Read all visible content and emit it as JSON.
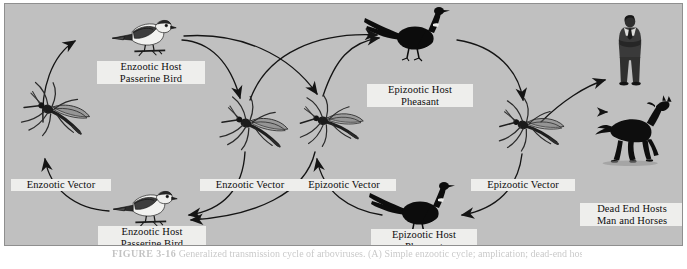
{
  "figure": {
    "caption_label": "FIGURE 3-16",
    "caption_text": "Generalized transmission cycle of arboviruses. (A) Simple enzootic cycle; amplication; dead-end hosts.",
    "background_color": "#c0c0c0",
    "border_color": "#8f8f8f",
    "ink_color": "#111111",
    "label_bg_color": "#eeeeec"
  },
  "nodes": [
    {
      "id": "enzootic-vector-left",
      "icon": "mosquito-icon",
      "label_lines": [
        "Enzootic Vector"
      ]
    },
    {
      "id": "enzootic-host-top",
      "icon": "passerine-bird-icon",
      "label_lines": [
        "Enzootic Host",
        "Passerine Bird"
      ]
    },
    {
      "id": "enzootic-vector-mid",
      "icon": "mosquito-icon",
      "label_lines": [
        "Enzootic Vector"
      ]
    },
    {
      "id": "epizootic-vector-mid",
      "icon": "mosquito-icon",
      "label_lines": [
        "Epizootic Vector"
      ]
    },
    {
      "id": "epizootic-host-top",
      "icon": "pheasant-icon",
      "label_lines": [
        "Epizootic Host",
        "Pheasant"
      ]
    },
    {
      "id": "epizootic-vector-right",
      "icon": "mosquito-icon",
      "label_lines": [
        "Epizootic Vector"
      ]
    },
    {
      "id": "dead-end-hosts",
      "icon": "man-and-horse-icon",
      "label_lines": [
        "Dead End Hosts",
        "Man and Horses"
      ]
    },
    {
      "id": "epizootic-host-bottom",
      "icon": "pheasant-icon",
      "label_lines": [
        "Epizootic Host",
        "Pheasant"
      ]
    },
    {
      "id": "enzootic-host-bottom",
      "icon": "passerine-bird-icon",
      "label_lines": [
        "Enzootic Host",
        "Passerine Bird"
      ]
    }
  ],
  "edges": [
    {
      "id": "edge-enz-vector-to-enz-bird-top",
      "from": "enzootic-vector-left",
      "to": "enzootic-host-top"
    },
    {
      "id": "edge-enz-bird-bottom-to-enz-vector",
      "from": "enzootic-host-bottom",
      "to": "enzootic-vector-left"
    },
    {
      "id": "edge-enz-bird-top-to-enz-vector-mid",
      "from": "enzootic-host-top",
      "to": "enzootic-vector-mid"
    },
    {
      "id": "edge-enz-bird-top-to-epi-vector-mid",
      "from": "enzootic-host-top",
      "to": "epizootic-vector-mid"
    },
    {
      "id": "edge-enz-vector-mid-to-epi-pheasant-top",
      "from": "enzootic-vector-mid",
      "to": "epizootic-host-top"
    },
    {
      "id": "edge-epi-vector-mid-to-epi-pheasant-top",
      "from": "epizootic-vector-mid",
      "to": "epizootic-host-top"
    },
    {
      "id": "edge-enz-vector-mid-to-enz-bird-bottom",
      "from": "enzootic-vector-mid",
      "to": "enzootic-host-bottom"
    },
    {
      "id": "edge-epi-vector-mid-to-enz-bird-bottom",
      "from": "epizootic-vector-mid",
      "to": "enzootic-host-bottom"
    },
    {
      "id": "edge-epi-pheasant-bottom-to-epi-vector-mid",
      "from": "epizootic-host-bottom",
      "to": "epizootic-vector-mid"
    },
    {
      "id": "edge-epi-pheasant-top-to-epi-vector-right",
      "from": "epizootic-host-top",
      "to": "epizootic-vector-right"
    },
    {
      "id": "edge-epi-vector-right-to-epi-pheasant-bottom",
      "from": "epizootic-vector-right",
      "to": "epizootic-host-bottom"
    },
    {
      "id": "edge-epi-vector-right-to-dead-end-hosts",
      "from": "epizootic-vector-right",
      "to": "dead-end-hosts"
    }
  ]
}
